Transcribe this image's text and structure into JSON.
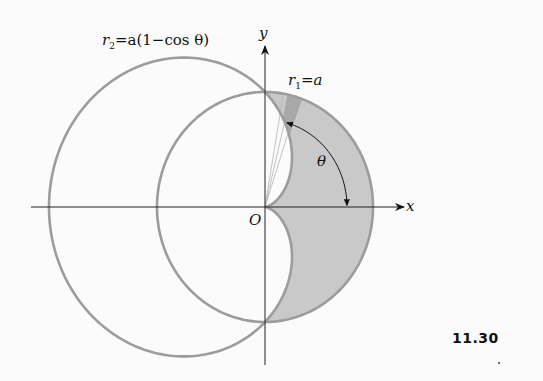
{
  "figure": {
    "number": "11.30",
    "labels": {
      "cardioid_r": "r",
      "cardioid_sub": "2",
      "cardioid_eq": "=a(1−cos θ)",
      "circle_r": "r",
      "circle_sub": "1",
      "circle_eq": "=a",
      "x_axis": "x",
      "y_axis": "y",
      "origin": "O",
      "angle": "θ"
    },
    "curves": [
      {
        "name": "cardioid",
        "equation": "r2 = a(1 - cos θ)"
      },
      {
        "name": "circle",
        "equation": "r1 = a"
      }
    ],
    "shaded_region": "region inside circle r1=a and outside cardioid r2, for -π/2 ≤ θ ≤ π/2",
    "colors": {
      "curve_stroke": "#9c9c9c",
      "shade_fill": "#c9c9c9",
      "wedge_fill": "#a8a8a8",
      "axis": "#222222",
      "background": "#fbfbfb"
    }
  }
}
